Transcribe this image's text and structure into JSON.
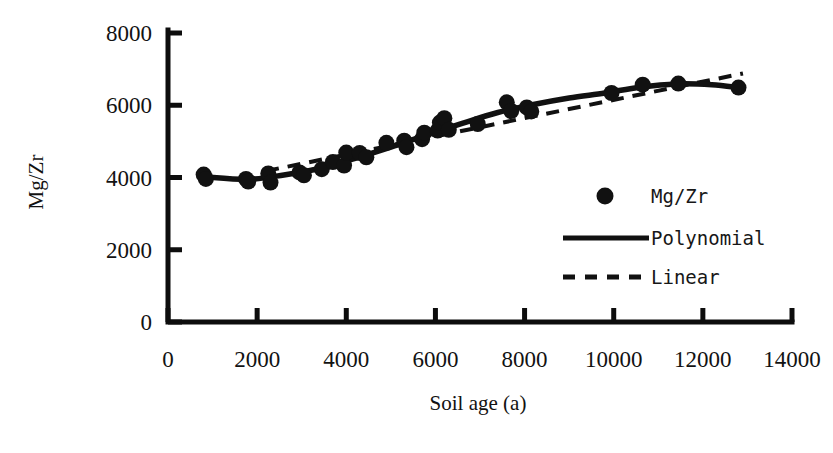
{
  "chart_data": {
    "type": "scatter",
    "title": "",
    "xlabel": "Soil age (a)",
    "ylabel": "Mg/Zr",
    "xlim": [
      0,
      14000
    ],
    "ylim": [
      0,
      8000
    ],
    "xticks": [
      0,
      2000,
      4000,
      6000,
      8000,
      10000,
      12000,
      14000
    ],
    "yticks": [
      0,
      2000,
      4000,
      6000,
      8000
    ],
    "xtick_labels": [
      "0",
      "2000",
      "4000",
      "6000",
      "8000",
      "10000",
      "12000",
      "14000"
    ],
    "ytick_labels": [
      "0",
      "2000",
      "4000",
      "6000",
      "8000"
    ],
    "grid": false,
    "legend_position": "center-right-inside",
    "legend": [
      {
        "label": "Mg/Zr",
        "marker": "filled-circle",
        "style": "marker"
      },
      {
        "label": "Polynomial",
        "marker": "solid-line",
        "style": "line"
      },
      {
        "label": "Linear",
        "marker": "dashed-line",
        "style": "dashed"
      }
    ],
    "series": [
      {
        "name": "Mg/Zr",
        "type": "scatter",
        "marker": "filled-circle",
        "color": "#111111",
        "points": [
          {
            "x": 800,
            "y": 4080
          },
          {
            "x": 850,
            "y": 3960
          },
          {
            "x": 1750,
            "y": 3960
          },
          {
            "x": 1800,
            "y": 3890
          },
          {
            "x": 2250,
            "y": 4110
          },
          {
            "x": 2300,
            "y": 3860
          },
          {
            "x": 2950,
            "y": 4140
          },
          {
            "x": 3050,
            "y": 4060
          },
          {
            "x": 3450,
            "y": 4230
          },
          {
            "x": 3700,
            "y": 4430
          },
          {
            "x": 3950,
            "y": 4330
          },
          {
            "x": 4000,
            "y": 4690
          },
          {
            "x": 4300,
            "y": 4680
          },
          {
            "x": 4450,
            "y": 4560
          },
          {
            "x": 4900,
            "y": 4960
          },
          {
            "x": 5300,
            "y": 5020
          },
          {
            "x": 5350,
            "y": 4840
          },
          {
            "x": 5700,
            "y": 5060
          },
          {
            "x": 5750,
            "y": 5240
          },
          {
            "x": 6050,
            "y": 5300
          },
          {
            "x": 6100,
            "y": 5520
          },
          {
            "x": 6200,
            "y": 5640
          },
          {
            "x": 6300,
            "y": 5320
          },
          {
            "x": 6950,
            "y": 5480
          },
          {
            "x": 7600,
            "y": 6080
          },
          {
            "x": 7700,
            "y": 5840
          },
          {
            "x": 8050,
            "y": 5940
          },
          {
            "x": 8150,
            "y": 5830
          },
          {
            "x": 9950,
            "y": 6340
          },
          {
            "x": 10650,
            "y": 6570
          },
          {
            "x": 11450,
            "y": 6600
          },
          {
            "x": 12800,
            "y": 6490
          }
        ]
      },
      {
        "name": "Polynomial",
        "type": "line",
        "style": "solid",
        "color": "#111111",
        "points": [
          {
            "x": 820,
            "y": 4020
          },
          {
            "x": 1800,
            "y": 3950
          },
          {
            "x": 2600,
            "y": 4070
          },
          {
            "x": 3400,
            "y": 4250
          },
          {
            "x": 4200,
            "y": 4530
          },
          {
            "x": 5000,
            "y": 4840
          },
          {
            "x": 5800,
            "y": 5180
          },
          {
            "x": 6600,
            "y": 5500
          },
          {
            "x": 7400,
            "y": 5800
          },
          {
            "x": 8200,
            "y": 6020
          },
          {
            "x": 9000,
            "y": 6200
          },
          {
            "x": 9800,
            "y": 6340
          },
          {
            "x": 10600,
            "y": 6500
          },
          {
            "x": 11400,
            "y": 6590
          },
          {
            "x": 12200,
            "y": 6570
          },
          {
            "x": 12800,
            "y": 6490
          }
        ]
      },
      {
        "name": "Linear",
        "type": "line",
        "style": "dashed",
        "color": "#111111",
        "points": [
          {
            "x": 2200,
            "y": 4180
          },
          {
            "x": 12900,
            "y": 6880
          }
        ]
      }
    ]
  },
  "axes": {
    "spine_color": "#0d0d0d",
    "tick_direction": "in"
  }
}
